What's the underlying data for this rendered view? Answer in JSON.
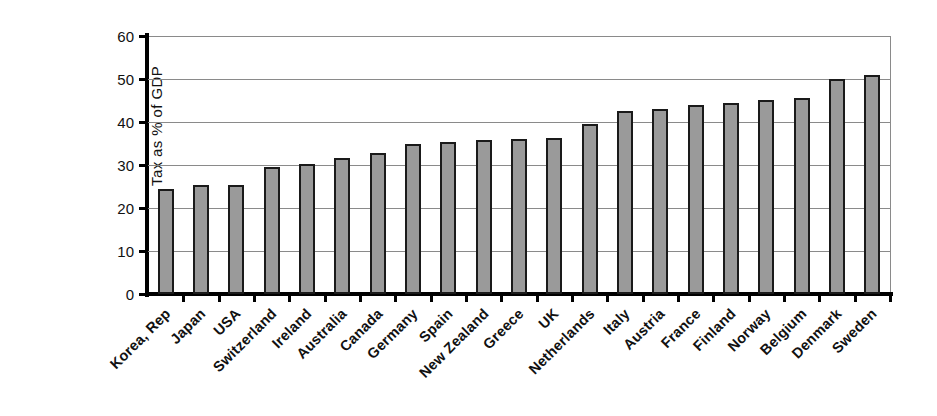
{
  "chart_data": {
    "type": "bar",
    "title": "",
    "subtitle": "",
    "xlabel": "",
    "ylabel": "Tax as % of GDP",
    "ylim": [
      0,
      60
    ],
    "ytick_labels": [
      "60",
      "50",
      "40",
      "30",
      "20",
      "10",
      "0"
    ],
    "ytick_values": [
      60,
      50,
      40,
      30,
      20,
      10,
      0
    ],
    "grid": true,
    "legend": null,
    "legend_position": "none",
    "bar_color": "#9a9a9a",
    "bar_edge_color": "#1a1a1a",
    "axis_color": "#000000",
    "gridline_color": "#8a8a8a",
    "categories": [
      "Korea, Rep",
      "Japan",
      "USA",
      "Switzerland",
      "Ireland",
      "Australia",
      "Canada",
      "Germany",
      "Spain",
      "New Zealand",
      "Greece",
      "UK",
      "Netherlands",
      "Italy",
      "Austria",
      "France",
      "Finland",
      "Norway",
      "Belgium",
      "Denmark",
      "Sweden"
    ],
    "values": [
      24.5,
      25.3,
      25.3,
      29.6,
      30.2,
      31.7,
      32.9,
      34.8,
      35.4,
      35.7,
      36.0,
      36.3,
      39.5,
      42.5,
      43.0,
      44.0,
      44.5,
      45.2,
      45.6,
      50.1,
      50.9
    ]
  }
}
